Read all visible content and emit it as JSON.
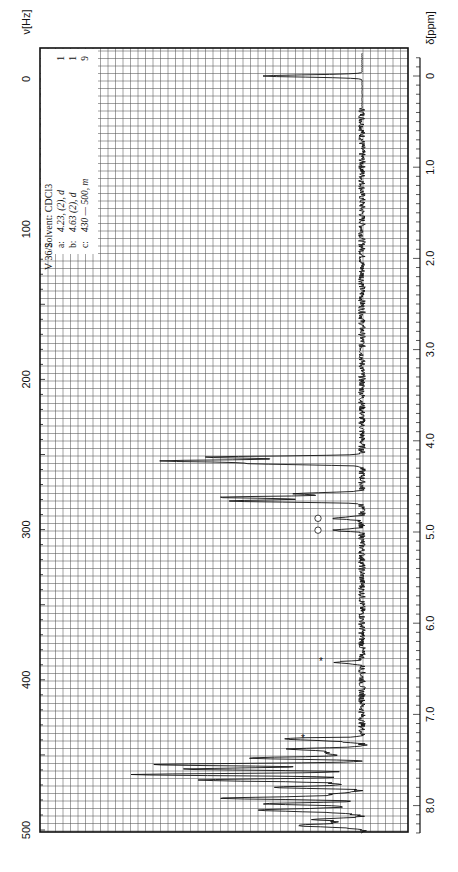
{
  "page_marker": "",
  "chart_data": {
    "type": "line",
    "orientation": "rotated-90",
    "spectrum_id": "V 36/2",
    "solvent": "Solvent: CDCl3",
    "annotations": [
      {
        "label": "a:",
        "text": "4.23, (2), d",
        "integral": "1"
      },
      {
        "label": "b:",
        "text": "4.63 (2), d",
        "integral": "1"
      },
      {
        "label": "c:",
        "text": "430 — 500, m",
        "integral": "9"
      }
    ],
    "hz_axis": {
      "label": "ν[Hz]",
      "min": 0,
      "max": 500,
      "ticks": [
        0,
        100,
        200,
        300,
        400,
        500
      ]
    },
    "ppm_axis": {
      "label": "δ[ppm]",
      "min": 0,
      "max": 8.3,
      "ticks": [
        "0",
        "1.0",
        "2.0",
        "3.0",
        "4.0",
        "5.0",
        "6.0",
        "7.0",
        "8.0"
      ]
    },
    "grid": true,
    "peaks_ppm": [
      {
        "ppm": 0.0,
        "intensity": 0.33,
        "note": "TMS reference"
      },
      {
        "ppm": 4.18,
        "intensity": 0.52
      },
      {
        "ppm": 4.22,
        "intensity": 0.65
      },
      {
        "ppm": 4.25,
        "intensity": 0.35
      },
      {
        "ppm": 4.58,
        "intensity": 0.22
      },
      {
        "ppm": 4.62,
        "intensity": 0.47
      },
      {
        "ppm": 4.66,
        "intensity": 0.44
      },
      {
        "ppm": 4.85,
        "intensity": 0.1,
        "marker": "circle"
      },
      {
        "ppm": 4.98,
        "intensity": 0.1,
        "marker": "circle"
      },
      {
        "ppm": 6.43,
        "intensity": 0.09,
        "marker": "asterisk"
      },
      {
        "ppm": 7.27,
        "intensity": 0.15,
        "marker": "asterisk"
      },
      {
        "ppm": 7.38,
        "intensity": 0.2
      },
      {
        "ppm": 7.48,
        "intensity": 0.37
      },
      {
        "ppm": 7.55,
        "intensity": 0.62
      },
      {
        "ppm": 7.6,
        "intensity": 0.5
      },
      {
        "ppm": 7.66,
        "intensity": 0.78
      },
      {
        "ppm": 7.72,
        "intensity": 0.45
      },
      {
        "ppm": 7.8,
        "intensity": 0.3
      },
      {
        "ppm": 7.92,
        "intensity": 0.4
      },
      {
        "ppm": 7.98,
        "intensity": 0.33
      },
      {
        "ppm": 8.05,
        "intensity": 0.25
      },
      {
        "ppm": 8.15,
        "intensity": 0.16
      },
      {
        "ppm": 8.22,
        "intensity": 0.1
      }
    ]
  }
}
